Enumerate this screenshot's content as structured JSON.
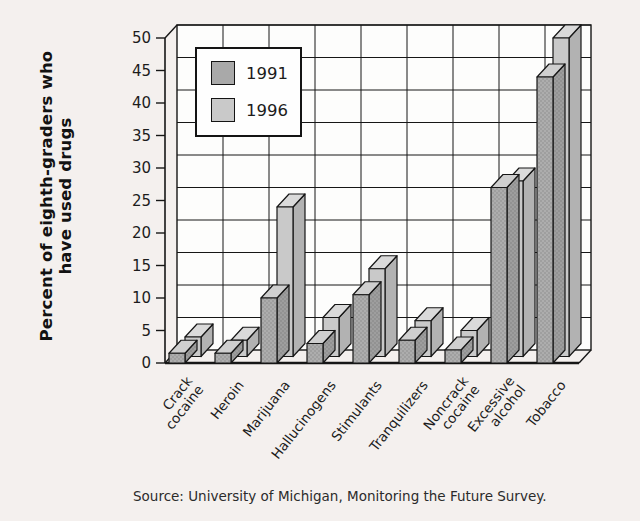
{
  "page": {
    "background": "#f4f0ee"
  },
  "ylabel_lines": [
    "Percent of eighth-graders who",
    "have used drugs"
  ],
  "legend": {
    "items": [
      {
        "label": "1991",
        "color": "#a9a9a9"
      },
      {
        "label": "1996",
        "color": "#c9c9c9"
      }
    ]
  },
  "source": "Source: University of Michigan, Monitoring the Future Survey.",
  "chart_data": {
    "type": "bar",
    "style": "3d-grouped-column",
    "title": "",
    "xlabel": "",
    "ylabel": "Percent of eighth-graders who have used drugs",
    "categories": [
      "Crack cocaine",
      "Heroin",
      "Marijuana",
      "Hallucinogens",
      "Stimulants",
      "Tranquilizers",
      "Noncrack cocaine",
      "Excessive alcohol",
      "Tobacco"
    ],
    "category_label_lines": [
      [
        "Crack",
        "cocaine"
      ],
      [
        "Heroin"
      ],
      [
        "Marijuana"
      ],
      [
        "Hallucinogens"
      ],
      [
        "Stimulants"
      ],
      [
        "Tranquilizers"
      ],
      [
        "Noncrack",
        "cocaine"
      ],
      [
        "Excessive",
        "alcohol"
      ],
      [
        "Tobacco"
      ]
    ],
    "series": [
      {
        "name": "1991",
        "color": "#a9a9a9",
        "values": [
          1.5,
          1.5,
          10,
          3,
          10.5,
          3.5,
          2,
          27,
          44
        ]
      },
      {
        "name": "1996",
        "color": "#c9c9c9",
        "values": [
          3,
          2.5,
          23,
          6,
          13.5,
          5.5,
          4,
          27,
          49
        ]
      }
    ],
    "yticks": [
      0,
      5,
      10,
      15,
      20,
      25,
      30,
      35,
      40,
      45,
      50
    ],
    "ylim": [
      0,
      50
    ],
    "grid": true,
    "legend_position": "top-left-inside",
    "line_color": "#161616",
    "wall_color": "#fdfdfc",
    "source": "Source: University of Michigan, Monitoring the Future Survey."
  }
}
